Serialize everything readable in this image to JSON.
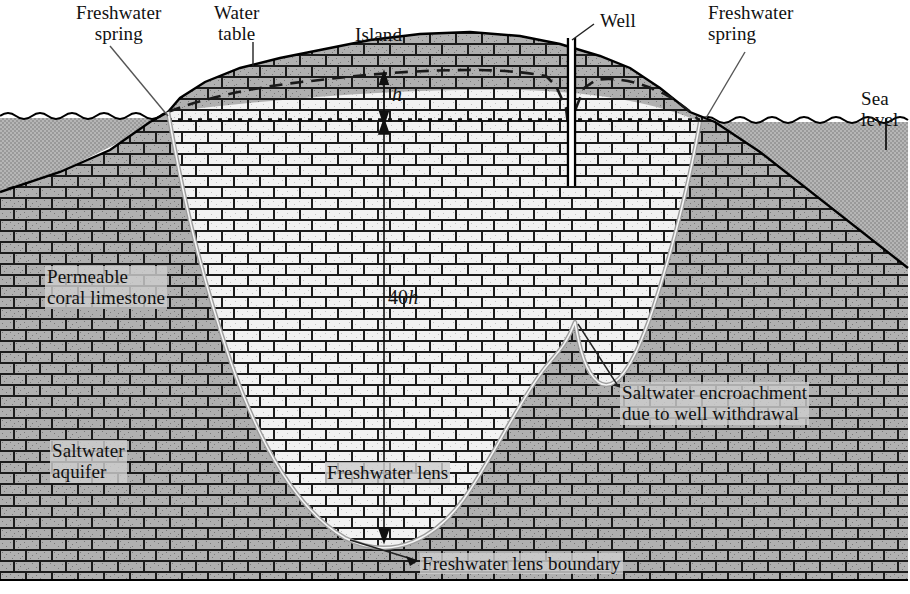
{
  "figure": {
    "width": 910,
    "height": 594
  },
  "labels": {
    "freshwater_spring_left": "Freshwater\nspring",
    "water_table": "Water\ntable",
    "island": "Island",
    "well": "Well",
    "freshwater_spring_right": "Freshwater\nspring",
    "sea_level": "Sea\nlevel",
    "h": "h",
    "forty_h": "40h",
    "permeable_coral_limestone": "Permeable\ncoral limestone",
    "saltwater_aquifer": "Saltwater\naquifer",
    "freshwater_lens": "Freshwater lens",
    "freshwater_lens_boundary": "Freshwater lens boundary",
    "saltwater_encroachment": "Saltwater encroachment\ndue to well withdrawal"
  },
  "colors": {
    "sea_fill": "#a9a9a9",
    "rock_outside_lens": "#b4b4b4",
    "rock_inside_lens": "#ececec",
    "mortar": "#1a1a1a",
    "outline": "#000000",
    "lens_boundary_line": "#8a8a8a",
    "label_box": "#cdcdcd",
    "text": "#111111",
    "background": "#ffffff"
  },
  "geometry": {
    "sea_level_y": 120,
    "rock_top_y": 120,
    "rock_bottom_y": 580,
    "lens_bottom_y": 540,
    "well_x": 571,
    "h_top_y": 78,
    "h_bottom_y": 120
  },
  "annotations": {
    "vertical_scale_note": "40h",
    "head_note": "h"
  }
}
